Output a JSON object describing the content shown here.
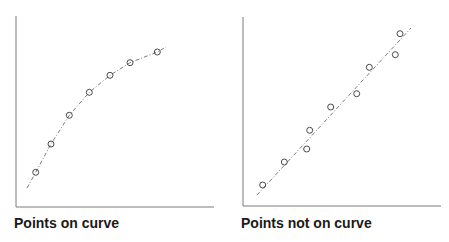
{
  "chart_data": [
    {
      "type": "scatter",
      "title": "Points on curve",
      "xlabel": "",
      "ylabel": "",
      "grid": false,
      "legend": null,
      "axis_color": "#777777",
      "marker": "open-circle",
      "fit": {
        "style": "dash-dot",
        "shape": "concave curve (saturating)"
      },
      "points_px": [
        [
          35.7,
          172.3
        ],
        [
          51,
          144
        ],
        [
          69.3,
          115.3
        ],
        [
          89.3,
          92.3
        ],
        [
          110,
          75.3
        ],
        [
          130,
          62.7
        ],
        [
          157.3,
          52
        ]
      ],
      "curve_px": [
        [
          27,
          188
        ],
        [
          35.7,
          172.3
        ],
        [
          51,
          144
        ],
        [
          69.3,
          115.3
        ],
        [
          89.3,
          92.3
        ],
        [
          110,
          75.3
        ],
        [
          130,
          62.7
        ],
        [
          157.3,
          52
        ],
        [
          166,
          47
        ]
      ],
      "axes_px": {
        "x0": 16,
        "y_top": 16,
        "y_base": 207,
        "x_end": 214
      },
      "series": [
        {
          "name": "observations",
          "x": [
            1,
            2,
            3,
            4,
            5,
            6,
            7
          ],
          "y": [
            18,
            33,
            48,
            60,
            69,
            76,
            81
          ]
        }
      ],
      "note": "Every observation lies exactly on the fitted curve"
    },
    {
      "type": "scatter",
      "title": "Points not on curve",
      "xlabel": "",
      "ylabel": "",
      "grid": false,
      "legend": null,
      "axis_color": "#777777",
      "marker": "open-circle",
      "fit": {
        "style": "dash-dot",
        "shape": "straight line"
      },
      "points_px": [
        [
          37.7,
          185
        ],
        [
          59.3,
          162
        ],
        [
          81.7,
          149
        ],
        [
          84.7,
          130.3
        ],
        [
          105.7,
          107
        ],
        [
          131.7,
          93.7
        ],
        [
          144.3,
          67.3
        ],
        [
          170.3,
          54.7
        ],
        [
          175,
          33.7
        ]
      ],
      "line_px": [
        [
          32,
          195
        ],
        [
          186,
          28
        ]
      ],
      "axes_px": {
        "x0": 18,
        "y_top": 17,
        "y_base": 206,
        "x_end": 216
      },
      "series": [
        {
          "name": "observations",
          "x": [
            1,
            2,
            3,
            3.2,
            4.2,
            5.4,
            6,
            7.2,
            7.4
          ],
          "y": [
            11,
            23,
            30,
            40,
            52,
            59,
            73,
            80,
            91
          ]
        }
      ],
      "note": "Observations scatter around a straight fitted line"
    }
  ]
}
